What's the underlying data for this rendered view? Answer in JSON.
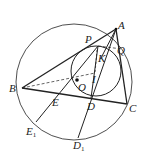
{
  "diagram": {
    "type": "geometry",
    "colors": {
      "stroke": "#222222",
      "background": "#ffffff"
    },
    "points": {
      "A": {
        "label": "A",
        "x": 116,
        "y": 29
      },
      "B": {
        "label": "B",
        "x": 22,
        "y": 88
      },
      "C": {
        "label": "C",
        "x": 127,
        "y": 104
      },
      "D": {
        "label": "D",
        "x": 91,
        "y": 98
      },
      "E": {
        "label": "E",
        "x": 54,
        "y": 94
      },
      "E1": {
        "label": "E",
        "sub": "1",
        "x": 36,
        "y": 122
      },
      "D1": {
        "label": "D",
        "sub": "1",
        "x": 78,
        "y": 138
      },
      "P": {
        "label": "P",
        "x": 98,
        "y": 46
      },
      "Q": {
        "label": "Q",
        "x": 122,
        "y": 49
      },
      "K": {
        "label": "K",
        "x": 101,
        "y": 58
      },
      "I": {
        "label": "I",
        "x": 95,
        "y": 73
      },
      "O": {
        "label": "O",
        "x": 77,
        "y": 78
      }
    },
    "circles": [
      {
        "name": "circumcircle",
        "cx": 74,
        "cy": 82,
        "r": 58
      },
      {
        "name": "incircle",
        "cx": 96,
        "cy": 71,
        "r": 25
      }
    ]
  }
}
